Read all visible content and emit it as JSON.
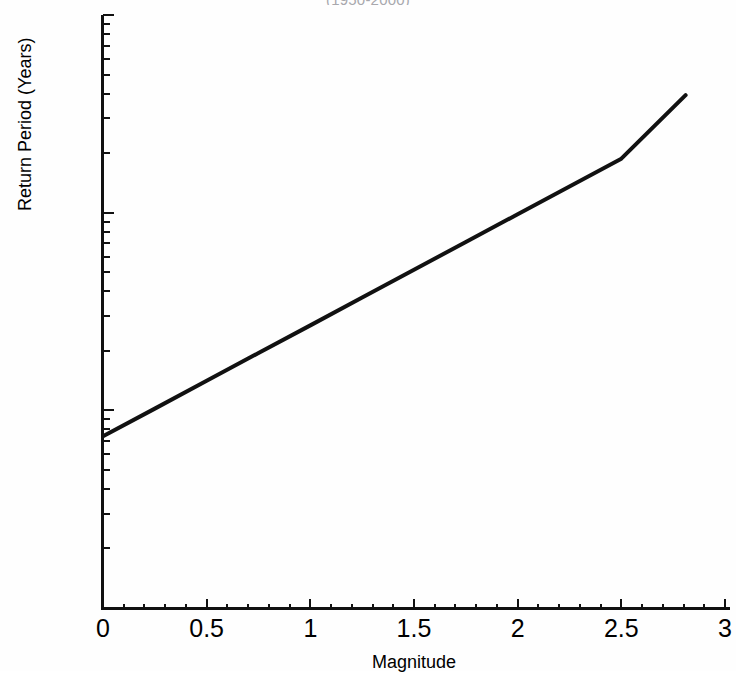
{
  "figure": {
    "title_cropped": "(1950-2000)",
    "background_color": "#ffffff",
    "line_color": "#111111",
    "axis_color": "#111111"
  },
  "chart_data": {
    "type": "line",
    "title": "(1950-2000)",
    "xlabel": "Magnitude",
    "ylabel": "Return Period (Years)",
    "xlim": [
      0,
      3
    ],
    "ylim": [
      0.01,
      10
    ],
    "yscale": "log",
    "xscale": "linear",
    "grid": false,
    "legend": "none",
    "x_ticks": [
      0,
      0.5,
      1,
      1.5,
      2,
      2.5,
      3
    ],
    "x_tick_labels": [
      "0",
      "0.5",
      "1",
      "1.5",
      "2",
      "2.5",
      "3"
    ],
    "x_minor_tick_step": 0.1,
    "y_ticks": [
      0.01,
      0.1,
      1,
      10
    ],
    "y_tick_labels": [
      "0.01",
      "0.1",
      "1",
      "10"
    ],
    "y_minor_ticks_per_decade": [
      2,
      3,
      4,
      5,
      6,
      7,
      8,
      9
    ],
    "series": [
      {
        "name": "Return period vs magnitude",
        "linewidth": 4,
        "x": [
          0,
          0.25,
          0.5,
          0.75,
          1,
          1.25,
          1.5,
          1.75,
          2,
          2.25,
          2.5,
          2.81
        ],
        "y": [
          0.074,
          0.102,
          0.141,
          0.195,
          0.269,
          0.372,
          0.514,
          0.711,
          0.982,
          1.357,
          1.875,
          3.93
        ]
      }
    ],
    "annotations": [
      "Straight line on semi-log axes: return period rises from about 0.074 years at magnitude 0 to about 3.9 years at magnitude 2.8"
    ]
  },
  "yaxis": {
    "labels": [
      {
        "value": "10",
        "decade_value": 10
      },
      {
        "value": "1",
        "decade_value": 1
      },
      {
        "value": "0.1",
        "decade_value": 0.1
      },
      {
        "value": "0.01",
        "decade_value": 0.01
      }
    ]
  },
  "xaxis": {
    "labels": [
      "0",
      "0.5",
      "1",
      "1.5",
      "2",
      "2.5",
      "3"
    ]
  }
}
